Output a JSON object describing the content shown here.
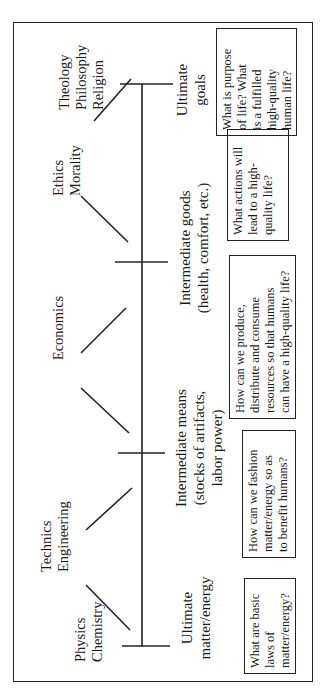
{
  "disciplines": [
    {
      "id": "physics",
      "label": "Physics\nChemistry"
    },
    {
      "id": "technics",
      "label": "Technics\nEngineering"
    },
    {
      "id": "economics",
      "label": "Economics"
    },
    {
      "id": "ethics",
      "label": "Ethics\nMorality"
    },
    {
      "id": "theology",
      "label": "Theology\nPhilosophy\nReligion"
    }
  ],
  "stages": [
    {
      "id": "ultimate-means",
      "label": "Ultimate\nmatter/energy"
    },
    {
      "id": "intermediate-means",
      "label": "Intermediate means\n(stocks of artifacts,\nlabor power)"
    },
    {
      "id": "intermediate-goods",
      "label": "Intermediate goods\n(health, comfort, etc.)"
    },
    {
      "id": "ultimate-goals",
      "label": "Ultimate\ngoals"
    }
  ],
  "questions": [
    {
      "id": "q-physics",
      "text": "What are basic\nlaws of\nmatter/energy?"
    },
    {
      "id": "q-technics",
      "text": "How can we fashion\nmatter/energy so as\nto benefit humans?"
    },
    {
      "id": "q-economics",
      "text": "How can we produce,\ndistribute and consume\nresources so that humans\ncan have a high-quality life?"
    },
    {
      "id": "q-ethics",
      "text": "What actions will\nlead to a high-\nquality life?"
    },
    {
      "id": "q-theology",
      "text": "What is purpose\nof life?  What\nis a fulfilled\nhigh-quality\nhuman life?"
    }
  ],
  "colors": {
    "line": "#222222",
    "text": "#1a1a1a",
    "background": "#ffffff"
  }
}
